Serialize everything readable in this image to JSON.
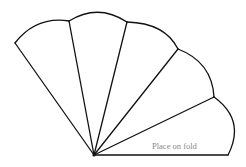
{
  "diagram": {
    "type": "pattern-template",
    "fold_label": "Place on fold",
    "colors": {
      "stroke": "#111111",
      "label": "#8a8a8a",
      "background": "#ffffff"
    },
    "center": [
      94,
      155
    ],
    "vertices": [
      [
        15,
        43
      ],
      [
        69,
        21
      ],
      [
        127,
        22
      ],
      [
        178,
        49
      ],
      [
        214,
        97
      ],
      [
        228,
        155
      ]
    ],
    "petal_count": 5
  }
}
